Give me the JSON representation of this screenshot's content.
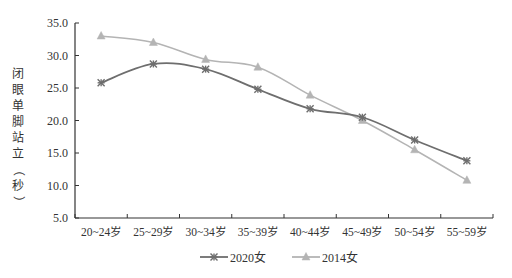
{
  "chart_data": {
    "type": "line",
    "title": "",
    "xlabel": "",
    "ylabel": "闭眼单脚站立（秒）",
    "categories": [
      "20~24岁",
      "25~29岁",
      "30~34岁",
      "35~39岁",
      "40~44岁",
      "45~49岁",
      "50~54岁",
      "55~59岁"
    ],
    "series": [
      {
        "name": "2020女",
        "marker": "asterisk-x",
        "color": "#6e6e6e",
        "values": [
          25.8,
          28.7,
          27.9,
          24.8,
          21.8,
          20.5,
          17.0,
          13.8
        ]
      },
      {
        "name": "2014女",
        "marker": "triangle",
        "color": "#b4b4b4",
        "values": [
          33.0,
          32.0,
          29.4,
          28.2,
          23.9,
          20.0,
          15.5,
          10.8
        ]
      }
    ],
    "yticks": [
      "5.0",
      "10.0",
      "15.0",
      "20.0",
      "25.0",
      "30.0",
      "35.0"
    ],
    "ylim": [
      5,
      35
    ],
    "grid": false,
    "legend_position": "bottom"
  },
  "ylabel_chars": [
    "闭",
    "眼",
    "单",
    "脚",
    "站",
    "立",
    "（",
    "秒",
    "）"
  ]
}
